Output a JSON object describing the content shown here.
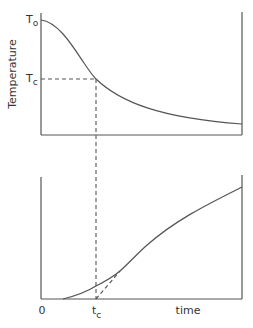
{
  "top_plot": {
    "ylabel": "Temperature",
    "t0_label": "T",
    "t0_sub": "o",
    "tc_label": "T",
    "tc_sub": "c"
  },
  "bottom_plot": {
    "origin_label": "0",
    "tc_label": "t",
    "tc_sub": "c",
    "xlabel": "time"
  },
  "colors": {
    "line": "#555555",
    "text": "#333333"
  }
}
